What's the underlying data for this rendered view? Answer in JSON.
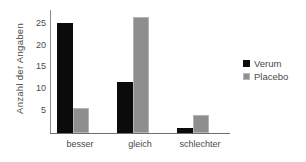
{
  "chart_data": {
    "type": "bar",
    "title": "",
    "subtitle": "",
    "xlabel": "",
    "ylabel": "Anzahl der Angaben",
    "categories": [
      "besser",
      "gleich",
      "schlechter"
    ],
    "series": [
      {
        "name": "Verum",
        "color": "#0b0b0b",
        "values": [
          25,
          11.5,
          1
        ]
      },
      {
        "name": "Placebo",
        "color": "#8e8e8e",
        "values": [
          5.5,
          26.5,
          4
        ]
      }
    ],
    "ylim": [
      0,
      28
    ],
    "yticks": [
      5,
      10,
      15,
      20,
      25
    ],
    "ytick_labels": [
      "5",
      "10",
      "15",
      "20",
      "25"
    ],
    "grid": false,
    "legend_position": "right",
    "annotations": []
  },
  "legend": {
    "items": [
      {
        "label": "Verum",
        "swatch": "black-square-swatch"
      },
      {
        "label": "Placebo",
        "swatch": "gray-square-swatch"
      }
    ]
  }
}
